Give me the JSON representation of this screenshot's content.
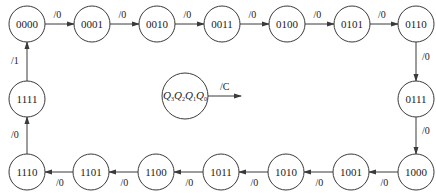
{
  "diagram": {
    "type": "state-transition-diagram",
    "stroke_color": "#3a3a3a",
    "states": [
      {
        "id": "0000",
        "label": "0000",
        "x": 27,
        "y": 24
      },
      {
        "id": "0001",
        "label": "0001",
        "x": 92,
        "y": 24
      },
      {
        "id": "0010",
        "label": "0010",
        "x": 157,
        "y": 24
      },
      {
        "id": "0011",
        "label": "0011",
        "x": 222,
        "y": 24
      },
      {
        "id": "0100",
        "label": "0100",
        "x": 287,
        "y": 24
      },
      {
        "id": "0101",
        "label": "0101",
        "x": 352,
        "y": 24
      },
      {
        "id": "0110",
        "label": "0110",
        "x": 416,
        "y": 24
      },
      {
        "id": "0111",
        "label": "0111",
        "x": 416,
        "y": 99
      },
      {
        "id": "1000",
        "label": "1000",
        "x": 416,
        "y": 172
      },
      {
        "id": "1001",
        "label": "1001",
        "x": 351,
        "y": 172
      },
      {
        "id": "1010",
        "label": "1010",
        "x": 286,
        "y": 172
      },
      {
        "id": "1011",
        "label": "1011",
        "x": 221,
        "y": 172
      },
      {
        "id": "1100",
        "label": "1100",
        "x": 156,
        "y": 172
      },
      {
        "id": "1101",
        "label": "1101",
        "x": 91,
        "y": 172
      },
      {
        "id": "1110",
        "label": "1110",
        "x": 27,
        "y": 172
      },
      {
        "id": "1111",
        "label": "1111",
        "x": 27,
        "y": 99
      }
    ],
    "transitions": [
      {
        "from": "0000",
        "to": "0001",
        "label": "/0"
      },
      {
        "from": "0001",
        "to": "0010",
        "label": "/0"
      },
      {
        "from": "0010",
        "to": "0011",
        "label": "/0"
      },
      {
        "from": "0011",
        "to": "0100",
        "label": "/0"
      },
      {
        "from": "0100",
        "to": "0101",
        "label": "/0"
      },
      {
        "from": "0101",
        "to": "0110",
        "label": "/0"
      },
      {
        "from": "0110",
        "to": "0111",
        "label": "/0"
      },
      {
        "from": "0111",
        "to": "1000",
        "label": "/0"
      },
      {
        "from": "1000",
        "to": "1001",
        "label": "/0"
      },
      {
        "from": "1001",
        "to": "1010",
        "label": "/0"
      },
      {
        "from": "1010",
        "to": "1011",
        "label": "/0"
      },
      {
        "from": "1011",
        "to": "1100",
        "label": "/0"
      },
      {
        "from": "1100",
        "to": "1101",
        "label": "/0"
      },
      {
        "from": "1101",
        "to": "1110",
        "label": "/0"
      },
      {
        "from": "1110",
        "to": "1111",
        "label": "/0"
      },
      {
        "from": "1111",
        "to": "0000",
        "label": "/1"
      }
    ],
    "legend": {
      "state_vars": [
        "Q",
        "Q",
        "Q",
        "Q"
      ],
      "subscripts": [
        "3",
        "2",
        "1",
        "0"
      ],
      "output_label": "/C"
    }
  }
}
